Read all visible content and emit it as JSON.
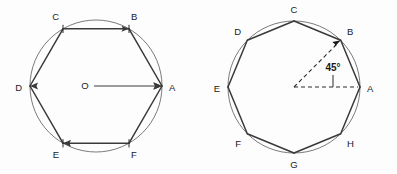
{
  "figure": {
    "background_color": "#fdfdfd",
    "stroke_color": "#3a3a3a",
    "circle_color": "#6b6b6b",
    "label_color": "#1a1a1a",
    "panels": [
      {
        "id": "left-hexagon",
        "shape": "regular-hexagon",
        "sides": 6,
        "center": {
          "x": 96,
          "y": 86,
          "label": "O"
        },
        "radius": 66,
        "central_angle_deg": 60,
        "has_center_marker": true,
        "radius_arrow": {
          "from": "O",
          "to": "A"
        },
        "vertices": [
          {
            "label": "A",
            "angle_deg": 0,
            "x": 162.0,
            "y": 86.0,
            "label_x": 169,
            "label_y": 88
          },
          {
            "label": "B",
            "angle_deg": 60,
            "x": 129.0,
            "y": 28.8,
            "label_x": 131,
            "label_y": 17
          },
          {
            "label": "C",
            "angle_deg": 120,
            "x": 63.0,
            "y": 28.8,
            "label_x": 57,
            "label_y": 17
          },
          {
            "label": "D",
            "angle_deg": 180,
            "x": 30.0,
            "y": 86.0,
            "label_x": 20,
            "label_y": 88
          },
          {
            "label": "E",
            "angle_deg": 240,
            "x": 63.0,
            "y": 143.2,
            "label_x": 57,
            "label_y": 155
          },
          {
            "label": "F",
            "angle_deg": 300,
            "x": 129.0,
            "y": 143.2,
            "label_x": 131,
            "label_y": 155
          }
        ]
      },
      {
        "id": "right-octagon",
        "shape": "regular-octagon",
        "sides": 8,
        "center": {
          "x": 294,
          "y": 87,
          "label": ""
        },
        "radius": 66,
        "central_angle_deg": 45,
        "angle_annotation": {
          "text": "45°",
          "x": 333,
          "y": 70,
          "from": "center",
          "to": "B"
        },
        "has_center_marker": false,
        "dashed_rays": [
          "center-to-A",
          "center-to-B"
        ],
        "vertices": [
          {
            "label": "A",
            "angle_deg": 0,
            "x": 360.0,
            "y": 87.0,
            "label_x": 367,
            "label_y": 89
          },
          {
            "label": "B",
            "angle_deg": 45,
            "x": 340.7,
            "y": 40.3,
            "label_x": 345,
            "label_y": 32
          },
          {
            "label": "C",
            "angle_deg": 90,
            "x": 294.0,
            "y": 21.0,
            "label_x": 292,
            "label_y": 10
          },
          {
            "label": "D",
            "angle_deg": 135,
            "x": 247.3,
            "y": 40.3,
            "label_x": 239,
            "label_y": 32
          },
          {
            "label": "E",
            "angle_deg": 180,
            "x": 228.0,
            "y": 87.0,
            "label_x": 217,
            "label_y": 89
          },
          {
            "label": "F",
            "angle_deg": 225,
            "x": 247.3,
            "y": 133.7,
            "label_x": 239,
            "label_y": 143
          },
          {
            "label": "G",
            "angle_deg": 270,
            "x": 294.0,
            "y": 153.0,
            "label_x": 292,
            "label_y": 164
          },
          {
            "label": "H",
            "angle_deg": 315,
            "x": 340.7,
            "y": 133.7,
            "label_x": 345,
            "label_y": 143
          }
        ]
      }
    ]
  }
}
